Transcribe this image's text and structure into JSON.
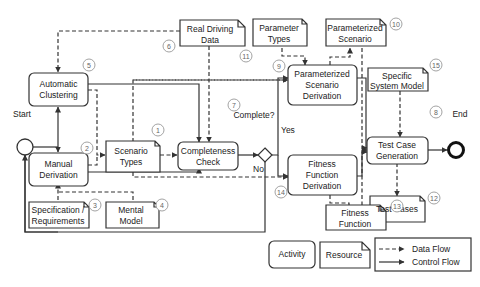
{
  "activities": {
    "automatic_clustering": [
      "Automatic",
      "Clustering"
    ],
    "manual_derivation": [
      "Manual",
      "Derivation"
    ],
    "completeness_check": [
      "Completeness",
      "Check"
    ],
    "parameterized_scenario_derivation": [
      "Parameterized",
      "Scenario",
      "Derivation"
    ],
    "fitness_function_derivation": [
      "Fitness",
      "Function",
      "Derivation"
    ],
    "test_case_generation": [
      "Test Case",
      "Generation"
    ]
  },
  "resources": {
    "real_driving_data": [
      "Real Driving",
      "Data"
    ],
    "scenario_types": [
      "Scenario",
      "Types"
    ],
    "specification_requirements": [
      "Specification /",
      "Requirements"
    ],
    "mental_model": [
      "Mental",
      "Model"
    ],
    "parameter_types": [
      "Parameter",
      "Types"
    ],
    "parameterized_scenario": [
      "Parameterized",
      "Scenario"
    ],
    "specific_system_model": [
      "Specific",
      "System Model"
    ],
    "test_cases": [
      "Test Cases"
    ],
    "fitness_function": [
      "Fitness",
      "Function"
    ]
  },
  "labels": {
    "start": "Start",
    "end": "End",
    "decision": "Complete?",
    "yes": "Yes",
    "no": "No"
  },
  "numbers": {
    "n1": "1",
    "n2": "2",
    "n3": "3",
    "n4": "4",
    "n5": "5",
    "n6": "6",
    "n7": "7",
    "n8": "8",
    "n9": "9",
    "n10": "10",
    "n11": "11",
    "n12": "12",
    "n13": "13",
    "n14": "14",
    "n15": "15"
  },
  "legend": {
    "activity": "Activity",
    "resource": "Resource",
    "data_flow": "Data Flow",
    "control_flow": "Control Flow"
  },
  "colors": {
    "stroke": "#333333",
    "text": "#222222",
    "number_circle": "#888888"
  }
}
